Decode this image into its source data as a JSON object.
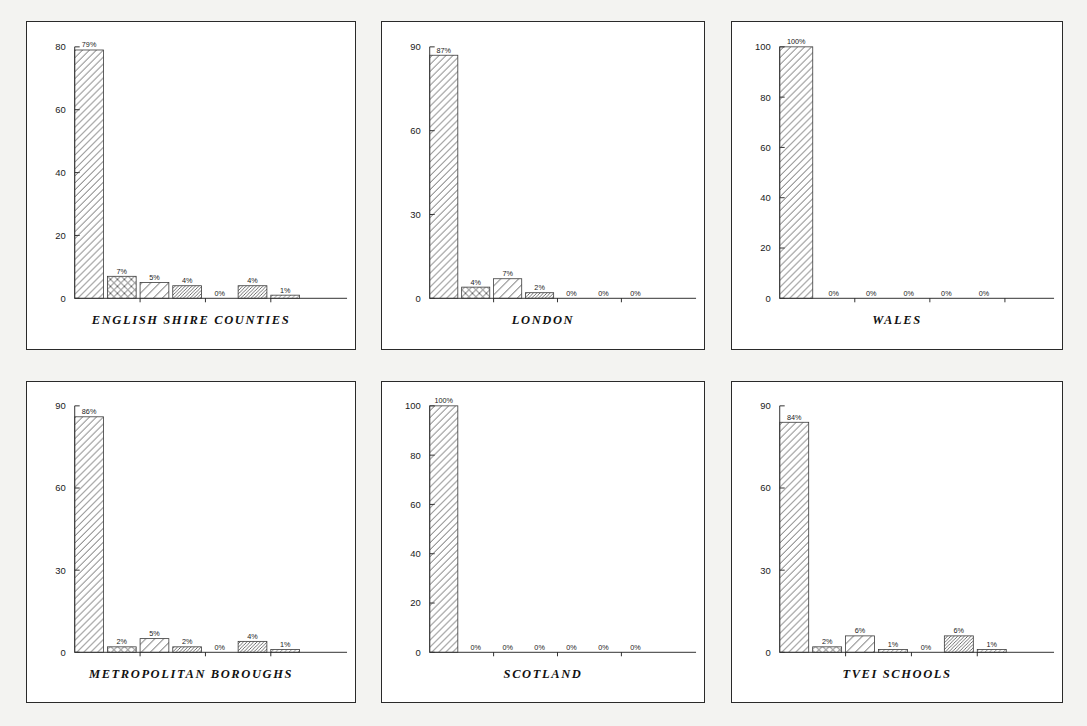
{
  "figure": {
    "background_color": "#f3f3f1",
    "panel_background": "#ffffff",
    "border_color": "#2a2a2a",
    "layout": "2 rows x 3 columns"
  },
  "chart_data": [
    {
      "type": "bar",
      "title": "ENGLISH SHIRE COUNTIES",
      "xlabel": "",
      "ylabel": "",
      "ylim": [
        0,
        80
      ],
      "yticks": [
        0,
        20,
        40,
        60,
        80
      ],
      "ytick_labels": [
        "0",
        "20",
        "40",
        "60",
        "80"
      ],
      "grid": false,
      "legend": "none",
      "categories": [
        "1",
        "2",
        "3",
        "4",
        "5",
        "6",
        "7"
      ],
      "values": [
        79,
        7,
        5,
        4,
        0,
        4,
        1
      ],
      "data_labels": [
        "79%",
        "7%",
        "5%",
        "4%",
        "0%",
        "4%",
        "1%"
      ],
      "patterns": [
        "diagonal",
        "crosshatch",
        "diagonal-wide",
        "diagonal-dense",
        "none",
        "diagonal-dense",
        "diagonal-fine"
      ]
    },
    {
      "type": "bar",
      "title": "LONDON",
      "xlabel": "",
      "ylabel": "",
      "ylim": [
        0,
        90
      ],
      "yticks": [
        0,
        30,
        60,
        90
      ],
      "ytick_labels": [
        "0",
        "30",
        "60",
        "90"
      ],
      "grid": false,
      "legend": "none",
      "categories": [
        "1",
        "2",
        "3",
        "4",
        "5",
        "6",
        "7"
      ],
      "values": [
        87,
        4,
        7,
        2,
        0,
        0,
        0
      ],
      "data_labels": [
        "87%",
        "4%",
        "7%",
        "2%",
        "0%",
        "0%",
        "0%"
      ],
      "patterns": [
        "diagonal",
        "crosshatch",
        "diagonal-wide",
        "diagonal-dense",
        "none",
        "none",
        "none"
      ]
    },
    {
      "type": "bar",
      "title": "WALES",
      "xlabel": "",
      "ylabel": "",
      "ylim": [
        0,
        100
      ],
      "yticks": [
        0,
        20,
        40,
        60,
        80,
        100
      ],
      "ytick_labels": [
        "0",
        "20",
        "40",
        "60",
        "80",
        "100"
      ],
      "grid": false,
      "legend": "none",
      "categories": [
        "1",
        "2",
        "3",
        "4",
        "5",
        "6"
      ],
      "values": [
        100,
        0,
        0,
        0,
        0,
        0
      ],
      "data_labels": [
        "100%",
        "0%",
        "0%",
        "0%",
        "0%",
        "0%"
      ],
      "patterns": [
        "diagonal",
        "none",
        "none",
        "none",
        "none",
        "none"
      ]
    },
    {
      "type": "bar",
      "title": "METROPOLITAN BOROUGHS",
      "xlabel": "",
      "ylabel": "",
      "ylim": [
        0,
        90
      ],
      "yticks": [
        0,
        30,
        60,
        90
      ],
      "ytick_labels": [
        "0",
        "30",
        "60",
        "90"
      ],
      "grid": false,
      "legend": "none",
      "categories": [
        "1",
        "2",
        "3",
        "4",
        "5",
        "6",
        "7"
      ],
      "values": [
        86,
        2,
        5,
        2,
        0,
        4,
        1
      ],
      "data_labels": [
        "86%",
        "2%",
        "5%",
        "2%",
        "0%",
        "4%",
        "1%"
      ],
      "patterns": [
        "diagonal",
        "crosshatch",
        "diagonal-wide",
        "diagonal-dense",
        "none",
        "diagonal-dense",
        "diagonal-fine"
      ]
    },
    {
      "type": "bar",
      "title": "SCOTLAND",
      "xlabel": "",
      "ylabel": "",
      "ylim": [
        0,
        100
      ],
      "yticks": [
        0,
        20,
        40,
        60,
        80,
        100
      ],
      "ytick_labels": [
        "0",
        "20",
        "40",
        "60",
        "80",
        "100"
      ],
      "grid": false,
      "legend": "none",
      "categories": [
        "1",
        "2",
        "3",
        "4",
        "5",
        "6",
        "7"
      ],
      "values": [
        100,
        0,
        0,
        0,
        0,
        0,
        0
      ],
      "data_labels": [
        "100%",
        "0%",
        "0%",
        "0%",
        "0%",
        "0%",
        "0%"
      ],
      "patterns": [
        "diagonal",
        "none",
        "none",
        "none",
        "none",
        "none",
        "none"
      ]
    },
    {
      "type": "bar",
      "title": "TVEI SCHOOLS",
      "xlabel": "",
      "ylabel": "",
      "ylim": [
        0,
        90
      ],
      "yticks": [
        0,
        30,
        60,
        90
      ],
      "ytick_labels": [
        "0",
        "30",
        "60",
        "90"
      ],
      "grid": false,
      "legend": "none",
      "categories": [
        "1",
        "2",
        "3",
        "4",
        "5",
        "6",
        "7"
      ],
      "values": [
        84,
        2,
        6,
        1,
        0,
        6,
        1
      ],
      "data_labels": [
        "84%",
        "2%",
        "6%",
        "1%",
        "0%",
        "6%",
        "1%"
      ],
      "patterns": [
        "diagonal",
        "crosshatch",
        "diagonal-wide",
        "diagonal-fine",
        "none",
        "diagonal-dense",
        "diagonal-fine"
      ]
    }
  ]
}
